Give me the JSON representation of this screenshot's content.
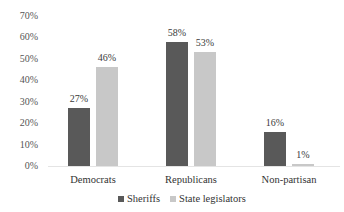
{
  "chart_data": {
    "type": "bar",
    "title": "",
    "xlabel": "",
    "ylabel": "",
    "categories": [
      "Democrats",
      "Republicans",
      "Non-partisan"
    ],
    "series": [
      {
        "name": "Sheriffs",
        "values": [
          27,
          58,
          16
        ],
        "labels": [
          "27%",
          "58%",
          "16%"
        ],
        "color": "#595959"
      },
      {
        "name": "State legislators",
        "values": [
          46,
          53,
          1
        ],
        "labels": [
          "46%",
          "53%",
          "1%"
        ],
        "color": "#c8c8c8"
      }
    ],
    "ylim": [
      0,
      70
    ],
    "yticks": [
      "0%",
      "10%",
      "20%",
      "30%",
      "40%",
      "50%",
      "60%",
      "70%"
    ],
    "grid": false,
    "legend_position": "bottom"
  }
}
